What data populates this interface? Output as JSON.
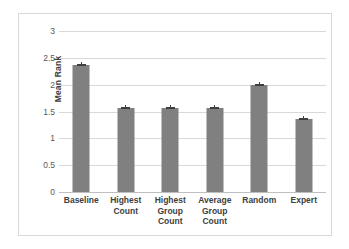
{
  "chart_data": {
    "type": "bar",
    "title": "",
    "subtitle": "",
    "xlabel": "",
    "ylabel": "Mean Rank",
    "ylim": [
      0,
      3
    ],
    "ytick_labels": [
      "3",
      "2.5",
      "2",
      "1.5",
      "1",
      "0.5",
      "0"
    ],
    "ytick_values": [
      3,
      2.5,
      2,
      1.5,
      1,
      0.5,
      0
    ],
    "grid": true,
    "legend": "none",
    "categories": [
      "Baseline",
      "Highest\nCount",
      "Highest\nGroup\nCount",
      "Average\nGroup\nCount",
      "Random",
      "Expert"
    ],
    "values": [
      2.37,
      1.56,
      1.56,
      1.57,
      1.99,
      1.36
    ],
    "error_bars": [
      0.02,
      0.02,
      0.02,
      0.02,
      0.02,
      0.02
    ],
    "bar_color": "#808080",
    "gridline_color": "#d9d9d9",
    "axis_color": "#bfbfbf",
    "text_color": "#404040",
    "tick_text_color": "#595959",
    "border_color": "#d9d9d9",
    "background_color": "#ffffff"
  }
}
